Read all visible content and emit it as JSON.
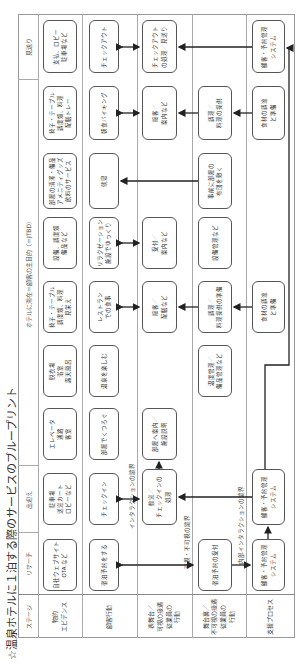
{
  "title": "☆温泉ホテルに１泊する際のサービスのブループリント",
  "stages": {
    "label": "ステージ",
    "research": "リサーチ",
    "arrival": "出迎え",
    "stay": "ホテルに滞在＝顧客の主目的（＝JTBD）",
    "departure": "見送り"
  },
  "rows": {
    "physical": "物的\nエビデンス",
    "customer": "顧客行動",
    "frontstage": "表舞台／\n可視の接遇\n従業員の\n行動",
    "backstage": "舞台裏／\n不可視の接遇\n従業員の\n行動",
    "support": "支援プロセス"
  },
  "boundaries": {
    "interaction": "インタラクションの境界",
    "visibility": "可視・不可視の境界",
    "internal": "内部インタラクションの境界"
  },
  "physical": [
    "自社ウェブサイト\nOTA など",
    "駐車場\n送迎カート\nロビーなど",
    "エレベータ\n通路\n客室",
    "脱衣場\n浴室\n露天風呂",
    "椅子・テーブル\n調度類、料理\n見栄え",
    "設備、調度類\n備品など",
    "部屋の清潔・備品\nアメニティグッズ\n飲料のサービス",
    "椅子・テーブル\n調度類、料理\n配膳トレー",
    "支払、ロビー\n駐車場など"
  ],
  "customer": [
    "宿泊予約をする",
    "チェックイン",
    "部屋でくつろぐ",
    "温泉を楽しむ",
    "レストラン\nでの食事",
    "リラクゼーション\n施設でゆっくり",
    "就寝",
    "朝食バイキング",
    "チェックアウト"
  ],
  "frontstage": {
    "arrival": "歓迎／\nチェックインの\n処理",
    "guide": "部屋へ案内／\n施設説明",
    "serve": "接客／\n配膳など",
    "reception": "受付／\n案内など",
    "breakfast": "接客／\n案内など",
    "checkout": "チェックアウト\nの処理／見送り"
  },
  "backstage": {
    "reservation": "宿泊予約の受付",
    "bath": "温度管理／\n備品管理など",
    "cook": "調理／\n料理提供の準備",
    "facility": "設備管理など",
    "bed": "事前に部屋の\n布団を敷く",
    "breakfast": "調理／\n料理の提供"
  },
  "support": {
    "system1": "顧客・予約管理\nシステム",
    "system2": "顧客・予約管理\nシステム",
    "food1": "食材の調達\nと準備",
    "food2": "食材の調達\nと準備",
    "system3": "顧客・予約管理\nシステム"
  }
}
